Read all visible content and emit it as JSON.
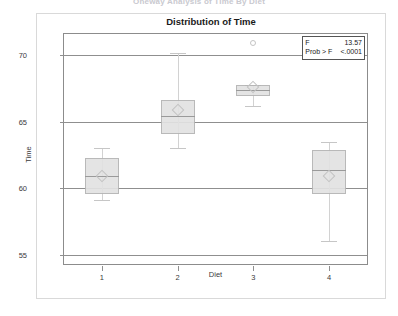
{
  "report": {
    "header_text": "Oneway Analysis of Time By Diet"
  },
  "chart_title": "Distribution of Time",
  "ftest": {
    "f_label": "F",
    "f_value": "13.57",
    "prob_label": "Prob > F",
    "prob_value": "<.0001"
  },
  "chart_data": {
    "type": "box",
    "title": "Distribution of Time",
    "xlabel": "Diet",
    "ylabel": "Time",
    "categories": [
      "1",
      "2",
      "3",
      "4"
    ],
    "ylim": [
      54.3,
      71.6
    ],
    "yticks": [
      55,
      60,
      65,
      70
    ],
    "grid": true,
    "legend_position": "top-right",
    "annotations": {
      "F": 13.57,
      "Prob > F": "<.0001"
    },
    "boxes": [
      {
        "category": "1",
        "whisker_low": 59.1,
        "q1": 59.6,
        "median": 60.9,
        "q3": 62.3,
        "whisker_high": 63.0,
        "mean": 60.9,
        "outliers": []
      },
      {
        "category": "2",
        "whisker_low": 63.0,
        "q1": 64.1,
        "median": 65.4,
        "q3": 66.6,
        "whisker_high": 70.2,
        "mean": 65.9,
        "outliers": []
      },
      {
        "category": "3",
        "whisker_low": 66.2,
        "q1": 66.9,
        "median": 67.4,
        "q3": 67.8,
        "whisker_high": 67.8,
        "mean": 67.6,
        "outliers": [
          70.9
        ]
      },
      {
        "category": "4",
        "whisker_low": 56.0,
        "q1": 59.6,
        "median": 61.4,
        "q3": 62.9,
        "whisker_high": 63.5,
        "mean": 60.9,
        "outliers": []
      }
    ]
  }
}
